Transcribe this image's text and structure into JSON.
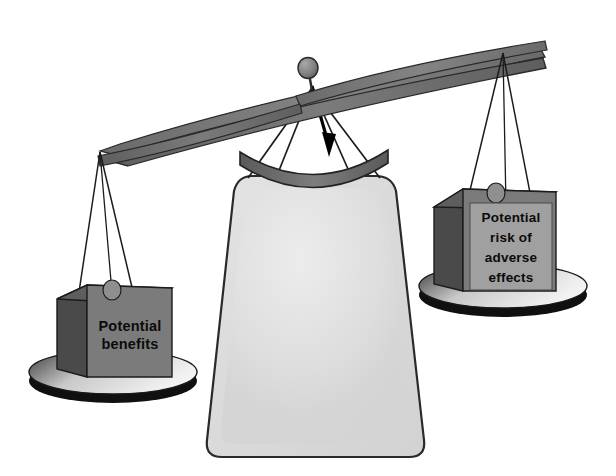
{
  "illustration": {
    "title": "Balance scale weighing potential benefits against potential risk of adverse effects",
    "alt_summary": "A two-pan balance with a large pale sack hanging from the central pivot; the left pan holds a box labelled Potential benefits and the right pan holds a box labelled Potential risk of adverse effects. A black arrow points downward from the pivot toward the sack."
  },
  "colors": {
    "background": "#ffffff",
    "outline": "#1a1a1a",
    "beam_fill": "#7e7e7e",
    "beam_shade": "#5c5c5c",
    "knob_fill": "#8a8a8a",
    "string": "#2b2b2b",
    "pan_top": "#d9d9d9",
    "pan_rim": "#111111",
    "pan_shadow": "#1a1a1a",
    "box_front": "#7b7b7b",
    "box_side": "#4a4a4a",
    "box_top": "#666666",
    "label_panel": "#a0a0a0",
    "sack_fill": "#dcdcdc",
    "sack_highlight": "#e9e9e9",
    "arc_fill": "#6e6e6e",
    "arrow": "#000000",
    "text": "#0b0b0b"
  },
  "left_weight": {
    "name": "potential-benefits-box",
    "label_lines": [
      "Potential",
      "benefits"
    ],
    "label_full": "Potential benefits"
  },
  "right_weight": {
    "name": "potential-risk-box",
    "label_lines": [
      "Potential",
      "risk of",
      "adverse",
      "effects"
    ],
    "label_full": "Potential risk of adverse effects"
  },
  "center_load": {
    "name": "central-sack",
    "label": ""
  },
  "pivot": {
    "name": "balance-pivot",
    "knob_label": ""
  },
  "arrow": {
    "name": "downward-arrow",
    "direction": "down",
    "label": ""
  }
}
